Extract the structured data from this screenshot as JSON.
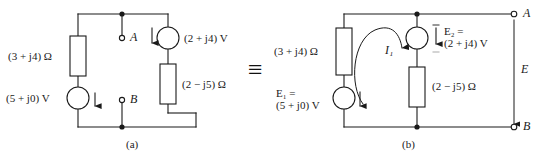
{
  "figure": {
    "equivalence_symbol": "≡",
    "panels": [
      {
        "id": "a",
        "caption": "(a)",
        "components": {
          "series_impedance": "(3 + j4) Ω",
          "source_left": "(5 + j0) V",
          "source_top_right": "(2 + j4) V",
          "shunt_impedance": "(2 − j5) Ω"
        },
        "terminals": {
          "a": "A",
          "b": "B"
        }
      },
      {
        "id": "b",
        "caption": "(b)",
        "components": {
          "series_impedance": "(3 + j4) Ω",
          "source_left_name": "E₁ =",
          "source_left_value": "(5 + j0) V",
          "source_mid_name": "E₂ =",
          "source_mid_value": "(2 + j4) V",
          "shunt_impedance": "(2 − j5) Ω"
        },
        "current_label": "I₁",
        "output_voltage_label": "E",
        "terminals": {
          "a": "A",
          "b": "B"
        }
      }
    ],
    "colors": {
      "line": "#1a1a1a",
      "background": "#ffffff",
      "text": "#1a1a1a"
    }
  }
}
